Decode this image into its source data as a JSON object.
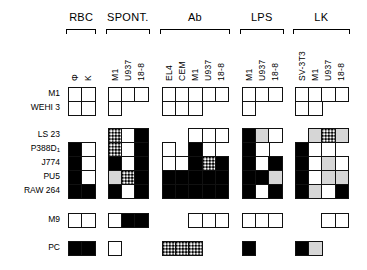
{
  "groups": [
    {
      "id": "rbc",
      "label": "RBC",
      "x": 68,
      "columns": [
        "Φ",
        "K"
      ]
    },
    {
      "id": "spont",
      "label": "SPONT.",
      "x": 108,
      "columns": [
        "M1",
        "U937",
        "18-8"
      ]
    },
    {
      "id": "ab",
      "label": "Ab",
      "x": 162,
      "columns": [
        "EL4",
        "CEM",
        "M1",
        "U937",
        "18-8"
      ]
    },
    {
      "id": "lps",
      "label": "LPS",
      "x": 242,
      "columns": [
        "M1",
        "U937",
        "18-8"
      ]
    },
    {
      "id": "lk",
      "label": "LK",
      "x": 295,
      "columns": [
        "SV-3T3",
        "M1",
        "U937",
        "18-8"
      ]
    }
  ],
  "rows": [
    {
      "label": "M1",
      "y": 87
    },
    {
      "label": "WEHI 3",
      "y": 101
    },
    {
      "label": "LS 23",
      "y": 128
    },
    {
      "label": "P388D",
      "sub": "1",
      "y": 142
    },
    {
      "label": "J774",
      "y": 156
    },
    {
      "label": "PU5",
      "y": 170
    },
    {
      "label": "RAW 264",
      "y": 184
    },
    {
      "label": "M9",
      "y": 213
    },
    {
      "label": "PC",
      "y": 241
    }
  ],
  "legend": {
    "W": "white / negative",
    "B": "black / positive",
    "G": "gray / weak",
    "D": "dotted / partial",
    "-": "not tested"
  },
  "cells": {
    "M1": {
      "rbc": "WW",
      "spont": "WWW",
      "ab": "WWWWW",
      "lps": "WWW",
      "lk": "WWWW"
    },
    "WEHI 3": {
      "rbc": "WW",
      "spont": "W--",
      "ab": "WWW--",
      "lps": "W--",
      "lk": "WW--"
    },
    "LS 23": {
      "rbc": "--",
      "spont": "DWB",
      "ab": "--WWW",
      "lps": "BGW",
      "lk": "-GDG"
    },
    "P388D1": {
      "rbc": "BW",
      "spont": "DWB",
      "ab": "W-BW-",
      "lps": "BW-",
      "lk": "BWW-"
    },
    "J774": {
      "rbc": "BW",
      "spont": "BWB",
      "ab": "WWBDB",
      "lps": "BWB",
      "lk": "BWGW"
    },
    "PU5": {
      "rbc": "BW",
      "spont": "GDB",
      "ab": "BBBBB",
      "lps": "BBG",
      "lk": "BWGG"
    },
    "RAW 264": {
      "rbc": "BB",
      "spont": "BWB",
      "ab": "BBBBB",
      "lps": "BWB",
      "lk": "BGWB"
    },
    "M9": {
      "rbc": "WW",
      "spont": "WBB",
      "ab": "--WWW",
      "lps": "WWW",
      "lk": "--WW"
    },
    "PC": {
      "rbc": "BB",
      "spont": "W--",
      "ab": "DDD--",
      "lps": "B--",
      "lk": "BG--"
    }
  },
  "cell_size": {
    "w": 13.2,
    "h": 14
  }
}
